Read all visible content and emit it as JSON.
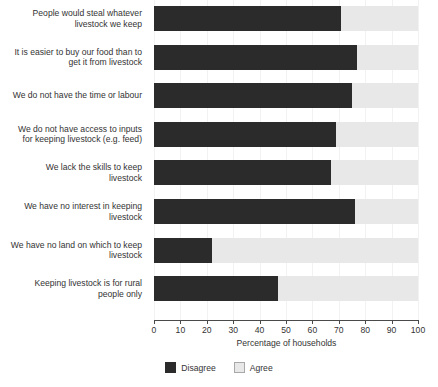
{
  "chart_data": {
    "type": "bar",
    "orientation": "horizontal",
    "stacked": true,
    "title": "",
    "xlabel": "Percentage of households",
    "ylabel": "",
    "xlim": [
      0,
      100
    ],
    "xticks": [
      0,
      10,
      20,
      30,
      40,
      50,
      60,
      70,
      80,
      90,
      100
    ],
    "xtick_labels": [
      "0",
      "10",
      "20",
      "30",
      "40",
      "50",
      "60",
      "70",
      "80",
      "90",
      "100"
    ],
    "grid": true,
    "legend_position": "bottom-center",
    "categories": [
      "People would steal whatever livestock we keep",
      "It is easier to buy our food than to get it from livestock",
      "We do not have the time or labour",
      "We do not have access to inputs for keeping livestock (e.g. feed)",
      "We lack the skills to keep livestock",
      "We have no interest in keeping livestock",
      "We have no land on which to keep livestock",
      "Keeping livestock is for rural people only"
    ],
    "category_lines": [
      [
        "People would steal whatever",
        "livestock we keep"
      ],
      [
        "It is easier to buy our food than to",
        "get it from livestock"
      ],
      [
        "We do not have the time or labour"
      ],
      [
        "We do not have access to inputs",
        "for keeping livestock (e.g. feed)"
      ],
      [
        "We lack the skills to keep",
        "livestock"
      ],
      [
        "We have no interest in keeping",
        "livestock"
      ],
      [
        "We have no land on which to keep",
        "livestock"
      ],
      [
        "Keeping livestock is for rural",
        "people only"
      ]
    ],
    "series": [
      {
        "name": "Disagree",
        "color": "#2b2b2b",
        "values": [
          71,
          77,
          75,
          69,
          67,
          76,
          22,
          47
        ]
      },
      {
        "name": "Agree",
        "color": "#e8e8e8",
        "values": [
          29,
          23,
          25,
          31,
          33,
          24,
          78,
          53
        ]
      }
    ],
    "legend": [
      {
        "label": "Disagree",
        "color": "#2b2b2b"
      },
      {
        "label": "Agree",
        "color": "#e8e8e8"
      }
    ]
  }
}
